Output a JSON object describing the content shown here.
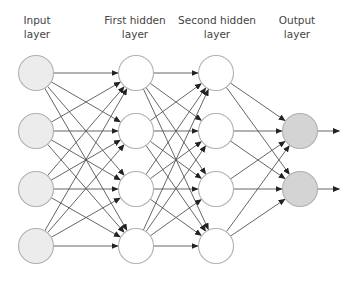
{
  "diagram": {
    "layers": [
      {
        "name": "input",
        "label_line1": "Input",
        "label_line2": "layer",
        "x": 36,
        "nodes": [
          73,
          131,
          189,
          246
        ],
        "fill": "#ececec"
      },
      {
        "name": "first-hidden",
        "label_line1": "First hidden",
        "label_line2": "layer",
        "x": 136,
        "nodes": [
          73,
          131,
          189,
          246
        ],
        "fill": "#ffffff"
      },
      {
        "name": "second-hidden",
        "label_line1": "Second hidden",
        "label_line2": "layer",
        "x": 216,
        "nodes": [
          73,
          131,
          189,
          246
        ],
        "fill": "#ffffff"
      },
      {
        "name": "output",
        "label_line1": "Output",
        "label_line2": "layer",
        "x": 300,
        "nodes": [
          131,
          189
        ],
        "fill": "#d4d4d4"
      }
    ],
    "node_radius": 17.5,
    "node_stroke": "#b0b0b0",
    "edge_color": "#555555",
    "output_arrow_length": 22,
    "connectivity": "fully-connected"
  }
}
